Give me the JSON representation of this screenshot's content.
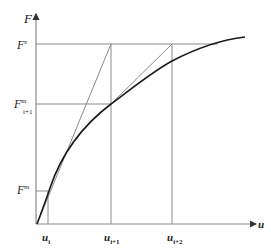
{
  "diagram": {
    "type": "secant-iteration-force-displacement",
    "axes": {
      "y_label": "F",
      "x_label": "u"
    },
    "y_markers": [
      {
        "base": "F",
        "sup": "s",
        "sub": "",
        "y": 44
      },
      {
        "base": "F",
        "sup": "m",
        "sub": "i+1",
        "y": 104
      },
      {
        "base": "F",
        "sup": "m",
        "sub": "",
        "y": 191
      }
    ],
    "x_markers": [
      {
        "base": "u",
        "sub": "i",
        "x": 48
      },
      {
        "base": "u",
        "sub": "i+1",
        "x": 111
      },
      {
        "base": "u",
        "sub": "i+2",
        "x": 172
      }
    ],
    "colors": {
      "axis": "#8a8a8a",
      "guide": "#8a8a8a",
      "curve": "#1a1a1a",
      "secant": "#8a8a8a",
      "text": "#222222"
    }
  }
}
